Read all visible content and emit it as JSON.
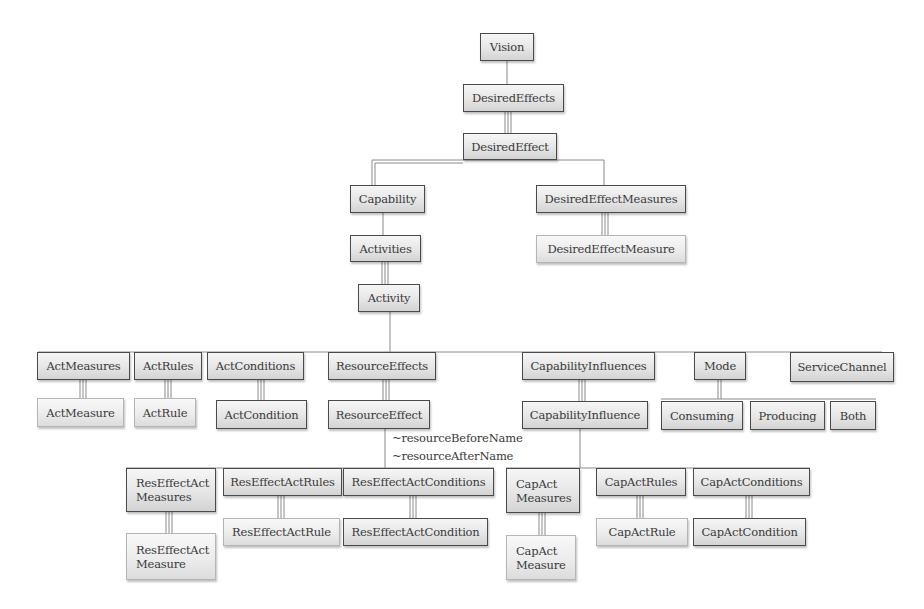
{
  "diagram": {
    "type": "hierarchy",
    "nodes": {
      "vision": "Vision",
      "desired_effects": "DesiredEffects",
      "desired_effect": "DesiredEffect",
      "capability": "Capability",
      "desired_effect_measures": "DesiredEffectMeasures",
      "desired_effect_measure": "DesiredEffectMeasure",
      "activities": "Activities",
      "activity": "Activity",
      "act_measures": "ActMeasures",
      "act_rules": "ActRules",
      "act_conditions": "ActConditions",
      "resource_effects": "ResourceEffects",
      "capability_influences": "CapabilityInfluences",
      "mode": "Mode",
      "service_channel": "ServiceChannel",
      "act_measure": "ActMeasure",
      "act_rule": "ActRule",
      "act_condition": "ActCondition",
      "resource_effect": "ResourceEffect",
      "capability_influence": "CapabilityInfluence",
      "consuming": "Consuming",
      "producing": "Producing",
      "both": "Both",
      "res_effect_act_measures": "ResEffectAct\nMeasures",
      "res_effect_act_rules": "ResEffectActRules",
      "res_effect_act_conditions": "ResEffectActConditions",
      "res_effect_act_measure": "ResEffectAct\nMeasure",
      "res_effect_act_rule": "ResEffectActRule",
      "res_effect_act_condition": "ResEffectActCondition",
      "cap_act_measures": "CapAct\nMeasures",
      "cap_act_rules": "CapActRules",
      "cap_act_conditions": "CapActConditions",
      "cap_act_measure": "CapAct\nMeasure",
      "cap_act_rule": "CapActRule",
      "cap_act_condition": "CapActCondition"
    },
    "annotations": {
      "resource_before": "~resourceBeforeName",
      "resource_after": "~resourceAfterName"
    },
    "edges": [
      {
        "from": "Vision",
        "to": "DesiredEffects",
        "style": "single"
      },
      {
        "from": "DesiredEffects",
        "to": "DesiredEffect",
        "style": "triple"
      },
      {
        "from": "DesiredEffect",
        "to": "Capability",
        "style": "double"
      },
      {
        "from": "DesiredEffect",
        "to": "DesiredEffectMeasures",
        "style": "single"
      },
      {
        "from": "Capability",
        "to": "Activities",
        "style": "single"
      },
      {
        "from": "DesiredEffectMeasures",
        "to": "DesiredEffectMeasure",
        "style": "triple"
      },
      {
        "from": "Activities",
        "to": "Activity",
        "style": "triple"
      },
      {
        "from": "Activity",
        "to": [
          "ActMeasures",
          "ActRules",
          "ActConditions",
          "ResourceEffects",
          "CapabilityInfluences",
          "Mode",
          "ServiceChannel"
        ],
        "style": "single"
      },
      {
        "from": "ActMeasures",
        "to": "ActMeasure",
        "style": "triple"
      },
      {
        "from": "ActRules",
        "to": "ActRule",
        "style": "triple"
      },
      {
        "from": "ActConditions",
        "to": "ActCondition",
        "style": "triple"
      },
      {
        "from": "ResourceEffects",
        "to": "ResourceEffect",
        "style": "triple"
      },
      {
        "from": "CapabilityInfluences",
        "to": "CapabilityInfluence",
        "style": "triple"
      },
      {
        "from": "Mode",
        "to": [
          "Consuming",
          "Producing",
          "Both"
        ],
        "style": "double"
      },
      {
        "from": "ResourceEffect",
        "to": [
          "ResEffectActMeasures",
          "ResEffectActRules",
          "ResEffectActConditions"
        ],
        "style": "single"
      },
      {
        "from": "CapabilityInfluence",
        "to": [
          "CapActMeasures",
          "CapActRules",
          "CapActConditions"
        ],
        "style": "single"
      },
      {
        "from": "ResEffectActMeasures",
        "to": "ResEffectActMeasure",
        "style": "triple"
      },
      {
        "from": "ResEffectActRules",
        "to": "ResEffectActRule",
        "style": "triple"
      },
      {
        "from": "ResEffectActConditions",
        "to": "ResEffectActCondition",
        "style": "triple"
      },
      {
        "from": "CapActMeasures",
        "to": "CapActMeasure",
        "style": "triple"
      },
      {
        "from": "CapActRules",
        "to": "CapActRule",
        "style": "triple"
      },
      {
        "from": "CapActConditions",
        "to": "CapActCondition",
        "style": "triple"
      }
    ]
  }
}
